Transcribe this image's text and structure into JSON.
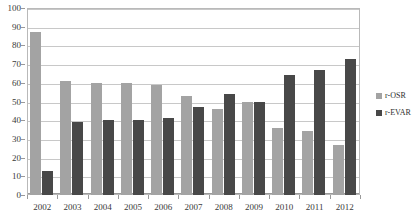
{
  "chart_data": {
    "type": "bar",
    "title": "",
    "subtitle": "",
    "xlabel": "",
    "ylabel": "",
    "ylim": [
      0,
      100
    ],
    "ytick_step": 10,
    "yticks": [
      0,
      10,
      20,
      30,
      40,
      50,
      60,
      70,
      80,
      90,
      100
    ],
    "grid": true,
    "grid_axis": "y",
    "legend_position": "right",
    "categories": [
      "2002",
      "2003",
      "2004",
      "2005",
      "2006",
      "2007",
      "2008",
      "2009",
      "2010",
      "2011",
      "2012"
    ],
    "series": [
      {
        "name": "r-OSR",
        "color": "#a3a3a3",
        "values": [
          87,
          61,
          60,
          60,
          59,
          53,
          46,
          50,
          36,
          34,
          27
        ]
      },
      {
        "name": "r-EVAR",
        "color": "#484848",
        "values": [
          13,
          39,
          40,
          40,
          41,
          47,
          54,
          50,
          64,
          67,
          73
        ]
      }
    ]
  },
  "legend": {
    "items": [
      {
        "label": "r-OSR",
        "color": "#a3a3a3",
        "swatch_icon": "square-swatch-icon"
      },
      {
        "label": "r-EVAR",
        "color": "#484848",
        "swatch_icon": "square-swatch-icon"
      }
    ]
  },
  "colors": {
    "plot_border": "#b9b9b9",
    "gridline": "#c8c8c8",
    "axis": "#9a9a9a",
    "tick_text": "#3a3a3a",
    "background": "#ffffff"
  }
}
